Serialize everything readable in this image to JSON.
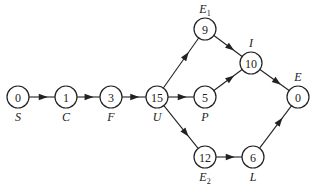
{
  "diagram": {
    "type": "directed-network",
    "nodes": [
      {
        "id": "S",
        "value": "0",
        "label": "S",
        "sub": "",
        "x": 18,
        "y": 97,
        "label_pos": "below"
      },
      {
        "id": "C",
        "value": "1",
        "label": "C",
        "sub": "",
        "x": 66,
        "y": 97,
        "label_pos": "below"
      },
      {
        "id": "F",
        "value": "3",
        "label": "F",
        "sub": "",
        "x": 111,
        "y": 97,
        "label_pos": "below"
      },
      {
        "id": "U",
        "value": "15",
        "label": "U",
        "sub": "",
        "x": 157,
        "y": 97,
        "label_pos": "below"
      },
      {
        "id": "E1",
        "value": "9",
        "label": "E",
        "sub": "1",
        "x": 205,
        "y": 29,
        "label_pos": "above"
      },
      {
        "id": "P",
        "value": "5",
        "label": "P",
        "sub": "",
        "x": 205,
        "y": 97,
        "label_pos": "below"
      },
      {
        "id": "I",
        "value": "10",
        "label": "I",
        "sub": "",
        "x": 251,
        "y": 63,
        "label_pos": "above"
      },
      {
        "id": "E",
        "value": "0",
        "label": "E",
        "sub": "",
        "x": 298,
        "y": 97,
        "label_pos": "above"
      },
      {
        "id": "E2",
        "value": "12",
        "label": "E",
        "sub": "2",
        "x": 205,
        "y": 157,
        "label_pos": "below"
      },
      {
        "id": "L",
        "value": "6",
        "label": "L",
        "sub": "",
        "x": 253,
        "y": 157,
        "label_pos": "below"
      }
    ],
    "edges": [
      {
        "from": "S",
        "to": "C"
      },
      {
        "from": "C",
        "to": "F"
      },
      {
        "from": "F",
        "to": "U"
      },
      {
        "from": "U",
        "to": "E1"
      },
      {
        "from": "U",
        "to": "P"
      },
      {
        "from": "U",
        "to": "E2"
      },
      {
        "from": "E1",
        "to": "I"
      },
      {
        "from": "P",
        "to": "I"
      },
      {
        "from": "I",
        "to": "E"
      },
      {
        "from": "E2",
        "to": "L"
      },
      {
        "from": "L",
        "to": "E"
      }
    ],
    "node_radius": 11
  }
}
